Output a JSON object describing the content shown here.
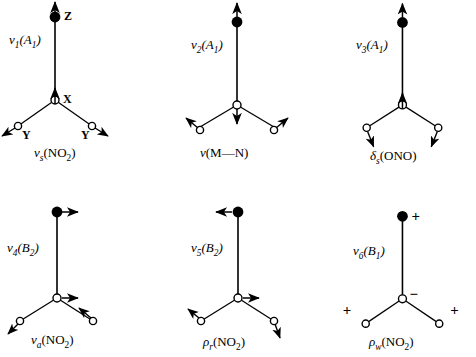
{
  "figure": {
    "type": "vibrational-mode-diagram",
    "molecule": "M-NO2 nitro complex",
    "atoms": {
      "Z": {
        "label": "Z",
        "role": "metal",
        "marker": "filled-circle"
      },
      "X": {
        "label": "X",
        "role": "nitrogen",
        "marker": "open-circle"
      },
      "Y": {
        "label": "Y",
        "role": "oxygen",
        "marker": "open-circle"
      }
    },
    "columns": 3,
    "rows": 2
  },
  "panels": [
    {
      "id": "mode-1",
      "mode_symbol": "ν",
      "mode_index": "1",
      "symmetry": "A",
      "symmetry_index": "1",
      "mode_label_full": "ν1(A1)",
      "caption_symbol": "ν",
      "caption_sub": "s",
      "caption_group": "(NO2)",
      "caption_full": "νs(NO2)",
      "show_atom_labels": true,
      "atom_label_z": "Z",
      "atom_label_x": "X",
      "atom_label_y_left": "Y",
      "atom_label_y_right": "Y",
      "description": "symmetric NO2 stretch; Z up, X up, Y atoms outward down-left and down-right"
    },
    {
      "id": "mode-2",
      "mode_symbol": "ν",
      "mode_index": "2",
      "symmetry": "A",
      "symmetry_index": "1",
      "mode_label_full": "ν2(A1)",
      "caption_symbol": "ν",
      "caption_sub": "",
      "caption_group": "(M—N)",
      "caption_full": "ν(M—N)",
      "show_atom_labels": false,
      "atom_label_z": "",
      "atom_label_x": "",
      "atom_label_y_left": "",
      "atom_label_y_right": "",
      "description": "M-N stretch; Z up, X down, Y atoms outward up-left and up-right"
    },
    {
      "id": "mode-3",
      "mode_symbol": "ν",
      "mode_index": "3",
      "symmetry": "A",
      "symmetry_index": "1",
      "mode_label_full": "ν3(A1)",
      "caption_symbol": "δ",
      "caption_sub": "s",
      "caption_group": "(ONO)",
      "caption_full": "δs(ONO)",
      "show_atom_labels": false,
      "atom_label_z": "",
      "atom_label_x": "",
      "atom_label_y_left": "",
      "atom_label_y_right": "",
      "description": "ONO symmetric bend; Z up, X up, Y atoms inward-downward"
    },
    {
      "id": "mode-4",
      "mode_symbol": "ν",
      "mode_index": "4",
      "symmetry": "B",
      "symmetry_index": "2",
      "mode_label_full": "ν4(B2)",
      "caption_symbol": "ν",
      "caption_sub": "a",
      "caption_group": "(NO2)",
      "caption_full": "νa(NO2)",
      "show_atom_labels": false,
      "atom_label_z": "",
      "atom_label_x": "",
      "atom_label_y_left": "",
      "atom_label_y_right": "",
      "description": "antisymmetric NO2 stretch; Z right, X right, left Y down-left, right Y up-left"
    },
    {
      "id": "mode-5",
      "mode_symbol": "ν",
      "mode_index": "5",
      "symmetry": "B",
      "symmetry_index": "2",
      "mode_label_full": "ν5(B2)",
      "caption_symbol": "ρ",
      "caption_sub": "r",
      "caption_group": "(NO2)",
      "caption_full": "ρr(NO2)",
      "show_atom_labels": false,
      "atom_label_z": "",
      "atom_label_x": "",
      "atom_label_y_left": "",
      "atom_label_y_right": "",
      "description": "NO2 rocking; Z left, X right, left Y up-left, right Y down-right"
    },
    {
      "id": "mode-6",
      "mode_symbol": "ν",
      "mode_index": "6",
      "symmetry": "B",
      "symmetry_index": "1",
      "mode_label_full": "ν6(B1)",
      "caption_symbol": "ρ",
      "caption_sub": "w",
      "caption_group": "(NO2)",
      "caption_full": "ρw(NO2)",
      "show_atom_labels": false,
      "atom_label_z": "",
      "atom_label_x": "",
      "atom_label_y_left": "",
      "atom_label_y_right": "",
      "signs": {
        "z": "+",
        "x": "−",
        "y_left": "+",
        "y_right": "+"
      },
      "description": "NO2 wagging; out-of-plane displacement shown by + and - signs"
    }
  ],
  "colors": {
    "ink": "#000000",
    "background": "#ffffff"
  }
}
